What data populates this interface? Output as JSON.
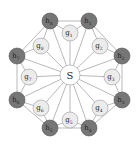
{
  "diagram": {
    "center": {
      "id": "S",
      "label": "S",
      "x": 70,
      "y": 75,
      "r": 10
    },
    "colors": {
      "outer_fill": "#767676",
      "inner_fill": "#ececec",
      "center_fill": "#ffffff",
      "edge": "#8a8a8a"
    },
    "inner_nodes": [
      {
        "id": "g1",
        "base": "g",
        "sub": "1",
        "x": 70,
        "y": 33
      },
      {
        "id": "g2",
        "base": "g",
        "sub": "2",
        "x": 100,
        "y": 46
      },
      {
        "id": "g3",
        "base": "g",
        "sub": "3",
        "x": 112,
        "y": 77
      },
      {
        "id": "g4",
        "base": "g",
        "sub": "4",
        "x": 100,
        "y": 108
      },
      {
        "id": "g5",
        "base": "g",
        "sub": "5",
        "x": 70,
        "y": 120
      },
      {
        "id": "g6",
        "base": "g",
        "sub": "6",
        "x": 41,
        "y": 108
      },
      {
        "id": "g7",
        "base": "g",
        "sub": "7",
        "x": 29,
        "y": 77
      },
      {
        "id": "g8",
        "base": "g",
        "sub": "8",
        "x": 41,
        "y": 46
      }
    ],
    "outer_nodes": [
      {
        "id": "h1",
        "base": "h",
        "sub": "1",
        "x": 89,
        "y": 21
      },
      {
        "id": "h2",
        "base": "h",
        "sub": "2",
        "x": 122,
        "y": 56
      },
      {
        "id": "h3",
        "base": "h",
        "sub": "3",
        "x": 122,
        "y": 100
      },
      {
        "id": "h4",
        "base": "h",
        "sub": "4",
        "x": 89,
        "y": 128
      },
      {
        "id": "h5",
        "base": "h",
        "sub": "5",
        "x": 50,
        "y": 128
      },
      {
        "id": "h6",
        "base": "h",
        "sub": "6",
        "x": 17,
        "y": 100
      },
      {
        "id": "h7",
        "base": "h",
        "sub": "7",
        "x": 17,
        "y": 56
      },
      {
        "id": "h8",
        "base": "h",
        "sub": "8",
        "x": 50,
        "y": 21
      }
    ],
    "node_radius": 8,
    "edges": {
      "center_to_all": true,
      "outer_ring": true,
      "inner_to_outer": [
        [
          "g1",
          "h8"
        ],
        [
          "g1",
          "h1"
        ],
        [
          "g2",
          "h1"
        ],
        [
          "g2",
          "h2"
        ],
        [
          "g3",
          "h2"
        ],
        [
          "g3",
          "h3"
        ],
        [
          "g4",
          "h3"
        ],
        [
          "g4",
          "h4"
        ],
        [
          "g5",
          "h4"
        ],
        [
          "g5",
          "h5"
        ],
        [
          "g6",
          "h5"
        ],
        [
          "g6",
          "h6"
        ],
        [
          "g7",
          "h6"
        ],
        [
          "g7",
          "h7"
        ],
        [
          "g8",
          "h7"
        ],
        [
          "g8",
          "h8"
        ]
      ]
    }
  }
}
